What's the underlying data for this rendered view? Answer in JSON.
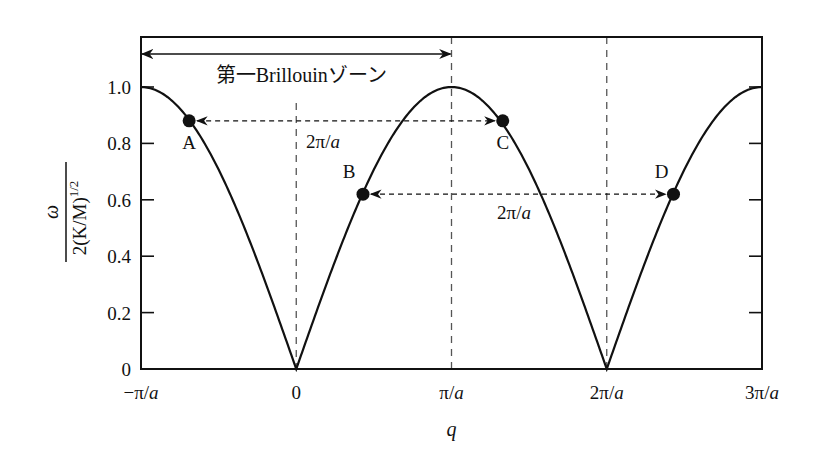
{
  "chart_data": {
    "type": "line",
    "title": "",
    "xlabel": "q",
    "ylabel": {
      "numerator": "ω",
      "denominator": "2(K/M)",
      "denominator_exponent": "1/2"
    },
    "xlim_pi_over_a": [
      -1,
      3
    ],
    "ylim": [
      0,
      1.15
    ],
    "x_ticks": [
      {
        "value_pi_over_a": -1,
        "label": "−π/a"
      },
      {
        "value_pi_over_a": 0,
        "label": "0"
      },
      {
        "value_pi_over_a": 1,
        "label": "π/a"
      },
      {
        "value_pi_over_a": 2,
        "label": "2π/a"
      },
      {
        "value_pi_over_a": 3,
        "label": "3π/a"
      }
    ],
    "y_ticks": [
      {
        "value": 0,
        "label": "0"
      },
      {
        "value": 0.2,
        "label": "0.2"
      },
      {
        "value": 0.4,
        "label": "0.4"
      },
      {
        "value": 0.6,
        "label": "0.6"
      },
      {
        "value": 0.8,
        "label": "0.8"
      },
      {
        "value": 1.0,
        "label": "1.0"
      }
    ],
    "grid": false,
    "series": [
      {
        "name": "dispersion",
        "function": "|sin(qa/2)|",
        "x_range_pi_over_a": [
          -1,
          3
        ]
      }
    ],
    "points": [
      {
        "label": "A",
        "q_pi_over_a": -0.69,
        "value": 0.88
      },
      {
        "label": "B",
        "q_pi_over_a": 0.43,
        "value": 0.62
      },
      {
        "label": "C",
        "q_pi_over_a": 1.33,
        "value": 0.88
      },
      {
        "label": "D",
        "q_pi_over_a": 2.43,
        "value": 0.62
      }
    ],
    "vertical_dashed_lines_pi_over_a": [
      0,
      1,
      2
    ],
    "annotations": {
      "zone_label": "第一Brillouinゾーン",
      "zone_range_pi_over_a": [
        -1,
        1
      ],
      "arrow_AC_label": "2π/a",
      "arrow_BD_label": "2π/a"
    }
  }
}
